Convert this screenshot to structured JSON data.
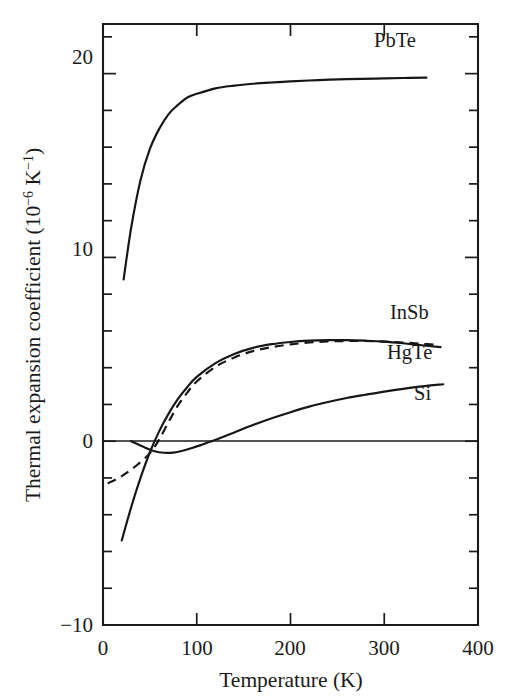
{
  "figure": {
    "background_color": "#ffffff",
    "ink_color": "#1a1a1a"
  },
  "axes": {
    "x": {
      "title": "Temperature (K)",
      "min": 0,
      "max": 400,
      "major_ticks": [
        0,
        100,
        200,
        300,
        400
      ],
      "tick_labels": [
        "0",
        "100",
        "200",
        "300",
        "400"
      ],
      "minor_tick_interval": 0
    },
    "y": {
      "title_parts": {
        "main": "Thermal expansion coefficient (10",
        "exp1": "−6",
        "mid": " K",
        "exp2": "−1",
        "tail": ")"
      },
      "title_plain": "Thermal expansion coefficient (10−6 K−1)",
      "min": -10,
      "max": 22.7,
      "major_ticks": [
        -10,
        0,
        10,
        20
      ],
      "tick_labels": [
        "−10",
        "0",
        "10",
        "20"
      ],
      "minor_tick_interval": 2
    }
  },
  "curve_labels": [
    {
      "name": "PbTe",
      "text": "PbTe"
    },
    {
      "name": "InSb",
      "text": "InSb"
    },
    {
      "name": "HgTe",
      "text": "HgTe"
    },
    {
      "name": "Si",
      "text": "Si"
    }
  ],
  "chart_data": {
    "type": "line",
    "title": "",
    "xlabel": "Temperature (K)",
    "ylabel": "Thermal expansion coefficient (10−6 K−1)",
    "xlim": [
      0,
      400
    ],
    "ylim": [
      -10,
      22.7
    ],
    "xticks": [
      0,
      100,
      200,
      300,
      400
    ],
    "yticks": [
      -10,
      0,
      10,
      20
    ],
    "grid": false,
    "legend": "inline curve labels",
    "zero_reference_line": 0,
    "series": [
      {
        "name": "PbTe",
        "style": "solid",
        "label_position": {
          "x": 290,
          "y": 21.6
        },
        "points": [
          [
            22,
            8.8
          ],
          [
            30,
            11.6
          ],
          [
            40,
            14.2
          ],
          [
            50,
            15.9
          ],
          [
            60,
            17.0
          ],
          [
            70,
            17.8
          ],
          [
            80,
            18.3
          ],
          [
            90,
            18.7
          ],
          [
            100,
            18.9
          ],
          [
            120,
            19.2
          ],
          [
            140,
            19.35
          ],
          [
            160,
            19.45
          ],
          [
            180,
            19.52
          ],
          [
            200,
            19.58
          ],
          [
            230,
            19.65
          ],
          [
            260,
            19.7
          ],
          [
            290,
            19.73
          ],
          [
            320,
            19.76
          ],
          [
            345,
            19.78
          ]
        ]
      },
      {
        "name": "InSb",
        "style": "solid",
        "label_position": {
          "x": 297,
          "y": 6.3
        },
        "points": [
          [
            20,
            -5.4
          ],
          [
            30,
            -3.6
          ],
          [
            40,
            -2.0
          ],
          [
            50,
            -0.6
          ],
          [
            60,
            0.55
          ],
          [
            70,
            1.5
          ],
          [
            80,
            2.3
          ],
          [
            90,
            2.95
          ],
          [
            100,
            3.5
          ],
          [
            120,
            4.25
          ],
          [
            140,
            4.75
          ],
          [
            160,
            5.08
          ],
          [
            180,
            5.28
          ],
          [
            200,
            5.4
          ],
          [
            220,
            5.47
          ],
          [
            240,
            5.5
          ],
          [
            260,
            5.5
          ],
          [
            280,
            5.47
          ],
          [
            300,
            5.42
          ],
          [
            320,
            5.33
          ],
          [
            340,
            5.22
          ],
          [
            360,
            5.12
          ]
        ]
      },
      {
        "name": "HgTe",
        "style": "dashed",
        "label_position": {
          "x": 293,
          "y": 4.35
        },
        "points": [
          [
            5,
            -2.3
          ],
          [
            20,
            -1.9
          ],
          [
            35,
            -1.35
          ],
          [
            50,
            -0.65
          ],
          [
            60,
            0.1
          ],
          [
            70,
            1.05
          ],
          [
            80,
            1.95
          ],
          [
            90,
            2.65
          ],
          [
            100,
            3.25
          ],
          [
            120,
            4.05
          ],
          [
            140,
            4.55
          ],
          [
            160,
            4.9
          ],
          [
            180,
            5.12
          ],
          [
            200,
            5.27
          ],
          [
            220,
            5.37
          ],
          [
            240,
            5.43
          ],
          [
            260,
            5.45
          ],
          [
            280,
            5.45
          ],
          [
            300,
            5.42
          ],
          [
            320,
            5.37
          ],
          [
            340,
            5.3
          ],
          [
            358,
            5.24
          ]
        ]
      },
      {
        "name": "Si",
        "style": "solid",
        "label_position": {
          "x": 322,
          "y": 2.85
        },
        "points": [
          [
            30,
            0.0
          ],
          [
            45,
            -0.35
          ],
          [
            55,
            -0.55
          ],
          [
            65,
            -0.63
          ],
          [
            75,
            -0.62
          ],
          [
            85,
            -0.52
          ],
          [
            95,
            -0.37
          ],
          [
            105,
            -0.2
          ],
          [
            115,
            -0.02
          ],
          [
            125,
            0.18
          ],
          [
            140,
            0.48
          ],
          [
            160,
            0.88
          ],
          [
            180,
            1.25
          ],
          [
            200,
            1.58
          ],
          [
            220,
            1.88
          ],
          [
            240,
            2.13
          ],
          [
            260,
            2.35
          ],
          [
            280,
            2.53
          ],
          [
            300,
            2.7
          ],
          [
            320,
            2.85
          ],
          [
            340,
            2.98
          ],
          [
            363,
            3.1
          ]
        ]
      }
    ]
  }
}
